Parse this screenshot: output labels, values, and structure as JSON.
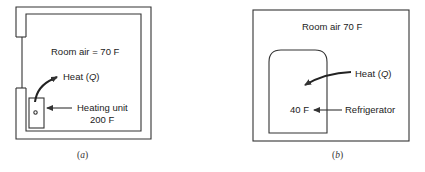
{
  "colors": {
    "line": "#333333",
    "text": "#222222",
    "background": "#ffffff"
  },
  "panel_a": {
    "caption_open": "(",
    "caption_letter": "a",
    "caption_close": ")",
    "room_air_label": "Room air = 70 F",
    "heat_label_prefix": "Heat (",
    "heat_label_q": "Q",
    "heat_label_suffix": ")",
    "heating_unit_label": "Heating unit",
    "heating_unit_temp": "200 F"
  },
  "panel_b": {
    "caption_open": "(",
    "caption_letter": "b",
    "caption_close": ")",
    "room_air_label": "Room air 70 F",
    "heat_label_prefix": "Heat (",
    "heat_label_q": "Q",
    "heat_label_suffix": ")",
    "fridge_temp": "40 F",
    "refrigerator_label": "Refrigerator"
  }
}
